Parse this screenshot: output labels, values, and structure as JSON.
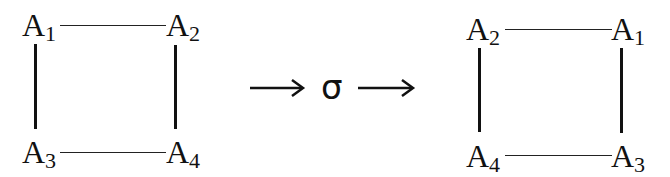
{
  "diagram": {
    "left_square": {
      "top_left": {
        "base": "A",
        "sub": "1"
      },
      "top_right": {
        "base": "A",
        "sub": "2"
      },
      "bottom_left": {
        "base": "A",
        "sub": "3"
      },
      "bottom_right": {
        "base": "A",
        "sub": "4"
      }
    },
    "operator": {
      "symbol": "σ"
    },
    "right_square": {
      "top_left": {
        "base": "A",
        "sub": "2"
      },
      "top_right": {
        "base": "A",
        "sub": "1"
      },
      "bottom_left": {
        "base": "A",
        "sub": "4"
      },
      "bottom_right": {
        "base": "A",
        "sub": "3"
      }
    },
    "colors": {
      "stroke": "#111111",
      "background": "#ffffff"
    }
  }
}
